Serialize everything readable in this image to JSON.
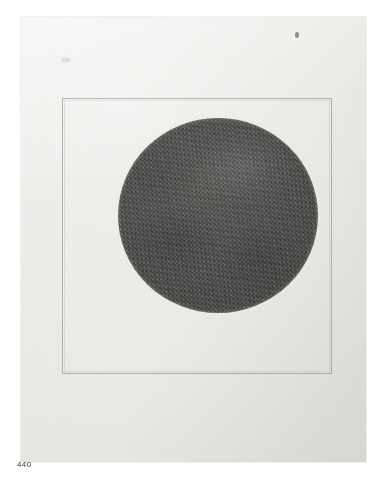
{
  "plate": {
    "caption": "440",
    "background_color": "#ffffff"
  },
  "sheet": {
    "name": "paper-sheet",
    "paper_color": "#ecebe8",
    "frame": {
      "name": "ruled-border-frame",
      "line_color": "#78766f"
    },
    "artwork": {
      "name": "charcoal-circle",
      "shape": "circle",
      "fill_color": "#4b4a48",
      "medium_appearance": "granular charcoal / graphite shading"
    },
    "marks": {
      "smudge_upper_right": "ink smudge",
      "smudge_upper_left": "faint smudge"
    }
  }
}
